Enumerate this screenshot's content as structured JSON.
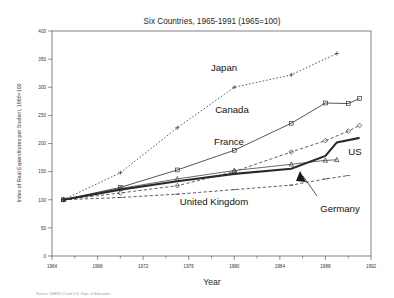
{
  "chart_data": {
    "type": "line",
    "title": "Six Countries, 1965-1991 (1965=100)",
    "xlabel": "Year",
    "ylabel": "Index of Real Expenditures per Student, 1965=100",
    "xlim": [
      1964,
      1992
    ],
    "ylim": [
      0,
      400
    ],
    "xticks": [
      1964,
      1968,
      1972,
      1976,
      1980,
      1984,
      1988,
      1992
    ],
    "xticklabels": [
      "1964",
      "1968",
      "1972",
      "1976",
      "1980",
      "1984",
      "1988",
      "1992"
    ],
    "xminorticks": [
      1966,
      1970,
      1974,
      1978,
      1982,
      1986,
      1990
    ],
    "yticks": [
      0,
      50,
      100,
      150,
      200,
      250,
      300,
      350,
      400
    ],
    "yticklabels": [
      "0",
      "50",
      "100",
      "150",
      "200",
      "250",
      "300",
      "350",
      "400"
    ],
    "grid": false,
    "legend_position": "inline-annotations",
    "series": [
      {
        "name": "Japan",
        "style": "dotted",
        "marker": "plus",
        "x": [
          1965,
          1970,
          1975,
          1980,
          1985,
          1989
        ],
        "values": [
          100,
          148,
          228,
          300,
          322,
          360
        ]
      },
      {
        "name": "Canada",
        "style": "solid",
        "marker": "square",
        "x": [
          1965,
          1970,
          1975,
          1980,
          1985,
          1988,
          1990
        ],
        "values": [
          100,
          122,
          153,
          188,
          236,
          272,
          271
        ]
      },
      {
        "name": "France",
        "style": "dashed",
        "marker": "diamond",
        "x": [
          1965,
          1970,
          1975,
          1980,
          1985,
          1988,
          1990,
          1991
        ],
        "values": [
          100,
          112,
          125,
          150,
          185,
          205,
          222,
          232
        ]
      },
      {
        "name": "US",
        "style": "thick-solid",
        "marker": "none",
        "x": [
          1965,
          1970,
          1975,
          1980,
          1985,
          1988,
          1989,
          1991
        ],
        "values": [
          100,
          118,
          133,
          146,
          155,
          178,
          202,
          210
        ]
      },
      {
        "name": "Germany",
        "style": "thin-solid",
        "marker": "triangle",
        "x": [
          1965,
          1970,
          1975,
          1980,
          1985,
          1988,
          1989
        ],
        "values": [
          100,
          120,
          137,
          152,
          163,
          170,
          171
        ]
      },
      {
        "name": "United Kingdom",
        "style": "dashed",
        "marker": "dash",
        "x": [
          1965,
          1970,
          1975,
          1980,
          1985,
          1988,
          1990
        ],
        "values": [
          100,
          104,
          110,
          118,
          126,
          137,
          143
        ]
      }
    ],
    "annotations": [
      {
        "text": "Japan",
        "series": "Japan"
      },
      {
        "text": "Canada",
        "series": "Canada"
      },
      {
        "text": "France",
        "series": "France"
      },
      {
        "text": "US",
        "series": "US"
      },
      {
        "text": "United Kingdom",
        "series": "United Kingdom"
      },
      {
        "text": "Germany",
        "series": "Germany",
        "has_arrow": true
      }
    ],
    "extra_canada_point": {
      "x": 1991,
      "value": 280
    }
  },
  "footer": {
    "source": "Source: UNESCO and U.S. Dept. of Education"
  },
  "colors": {
    "background": "#ffffff",
    "axis": "#4d4d4d",
    "line": "#2a2a2a",
    "text": "#1a1a1a",
    "muted": "#9a9a9a"
  }
}
